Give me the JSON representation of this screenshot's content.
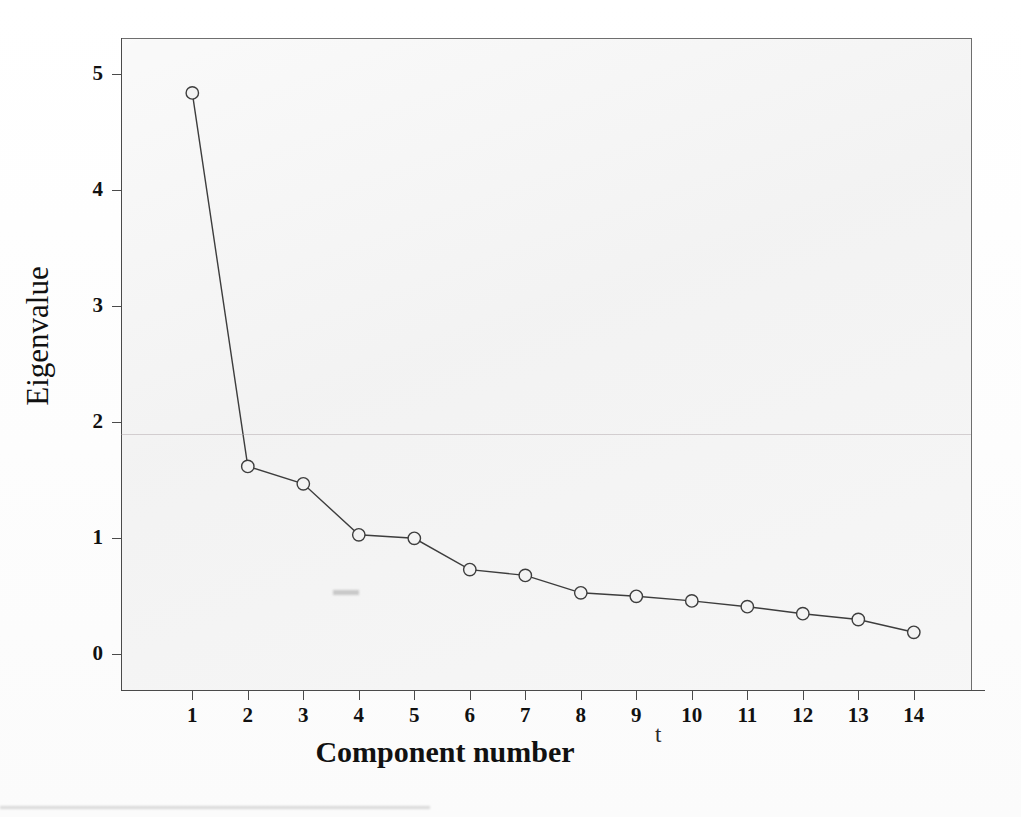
{
  "chart_data": {
    "type": "line",
    "title": "",
    "subtitle": "",
    "xlabel": "Component number",
    "ylabel": "Eigenvalue",
    "x": [
      1,
      2,
      3,
      4,
      5,
      6,
      7,
      8,
      9,
      10,
      11,
      12,
      13,
      14
    ],
    "categories": [
      "1",
      "2",
      "3",
      "4",
      "5",
      "6",
      "7",
      "8",
      "9",
      "10",
      "11",
      "12",
      "13",
      "14"
    ],
    "values": [
      4.84,
      1.62,
      1.47,
      1.03,
      1.0,
      0.73,
      0.68,
      0.53,
      0.5,
      0.46,
      0.41,
      0.35,
      0.3,
      0.19
    ],
    "series": [
      {
        "name": "Eigenvalue",
        "values": [
          4.84,
          1.62,
          1.47,
          1.03,
          1.0,
          0.73,
          0.68,
          0.53,
          0.5,
          0.46,
          0.41,
          0.35,
          0.3,
          0.19
        ]
      }
    ],
    "xlim": [
      0.35,
      14.75
    ],
    "ylim": [
      -0.32,
      5.3
    ],
    "xticks": [
      "1",
      "2",
      "3",
      "4",
      "5",
      "6",
      "7",
      "8",
      "9",
      "10",
      "11",
      "12",
      "13",
      "14"
    ],
    "yticks": [
      "0",
      "1",
      "2",
      "3",
      "4",
      "5"
    ],
    "ytick_values": [
      0,
      1,
      2,
      3,
      4,
      5
    ],
    "grid": false,
    "legend": null,
    "legend_position": "none",
    "marker": "open-circle",
    "line_color": "#3d3d3d",
    "marker_fill": "#f3f3f3",
    "panel_background": "#f3f3f3",
    "axis_color": "#4a4a4a",
    "annotations": [
      {
        "name": "scan-artifact-mark",
        "text": "t"
      }
    ]
  },
  "figure": {
    "page_background": "#fefefe"
  }
}
